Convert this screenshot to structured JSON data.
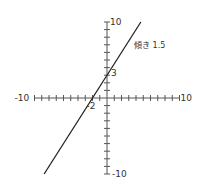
{
  "chart_data": {
    "type": "line",
    "title": "",
    "xlabel": "",
    "ylabel": "",
    "xlim": [
      -10,
      10
    ],
    "ylim": [
      -10,
      10
    ],
    "grid": false,
    "tick_step": 1,
    "axis_tick_labels": {
      "x_min": "-10",
      "x_max": "10",
      "y_min": "-10",
      "y_max": "10"
    },
    "series": [
      {
        "name": "y = 1.5x + 3",
        "slope": 1.5,
        "intercept": 3,
        "x": [
          -8.67,
          4.67
        ],
        "y": [
          -10,
          10
        ]
      }
    ],
    "annotations": [
      {
        "text": "傾き 1.5",
        "meaning": "slope 1.5"
      },
      {
        "text": "3",
        "meaning": "y-intercept"
      },
      {
        "text": "-2",
        "meaning": "x-intercept"
      }
    ],
    "colors": {
      "line": "#222222",
      "axis": "#555555"
    }
  }
}
